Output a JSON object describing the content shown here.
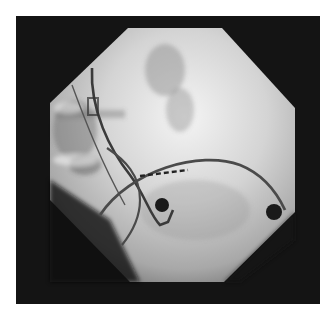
{
  "image": {
    "type": "fluoroscopy",
    "description": "Octagonal X-ray fluoroscopic field showing intracardiac catheters with electrode markers",
    "colors": {
      "background": "#ffffff",
      "frame": "#141414",
      "field_light": "#e6e6e6",
      "field_mid": "#9a9a9a",
      "catheter": "#4a4a4a",
      "marker": "#1a1a1a"
    },
    "elements": [
      {
        "name": "octagonal-field"
      },
      {
        "name": "curved-catheter-long"
      },
      {
        "name": "looped-catheter"
      },
      {
        "name": "straight-lead"
      },
      {
        "name": "dashed-electrode-array"
      },
      {
        "name": "round-marker-center"
      },
      {
        "name": "round-marker-right"
      }
    ]
  }
}
